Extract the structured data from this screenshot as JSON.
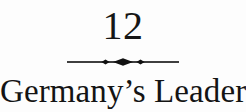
{
  "page": {
    "type": "book-chapter-opener",
    "background_color": "#fdfdfd",
    "text_color": "#161616"
  },
  "chapter": {
    "number": "12",
    "title": "Germany’s Leaders"
  },
  "divider": {
    "icon_name": "diamond-ornament-divider",
    "description": "horizontal rule with central lozenge flanked by two small diamonds",
    "color": "#111111",
    "rule_width": 108,
    "rule_thickness": 1.6
  }
}
